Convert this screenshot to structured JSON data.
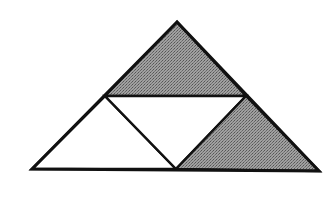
{
  "diagram": {
    "colors": {
      "background": "#ffffff",
      "stroke": "#111111",
      "shaded_fill": "#8a8a8a",
      "unshaded_fill": "#ffffff"
    },
    "vertices": {
      "apex": [
        177,
        22
      ],
      "mid_left": [
        105,
        96
      ],
      "mid_right": [
        246,
        96
      ],
      "bottom_left": [
        32,
        169
      ],
      "bottom_mid": [
        176,
        169
      ],
      "bottom_right": [
        319,
        171
      ]
    },
    "regions": [
      {
        "name": "top-triangle",
        "shaded": true
      },
      {
        "name": "bottom-left-triangle",
        "shaded": false
      },
      {
        "name": "center-inverted-triangle",
        "shaded": false
      },
      {
        "name": "bottom-right-triangle",
        "shaded": true
      }
    ]
  }
}
